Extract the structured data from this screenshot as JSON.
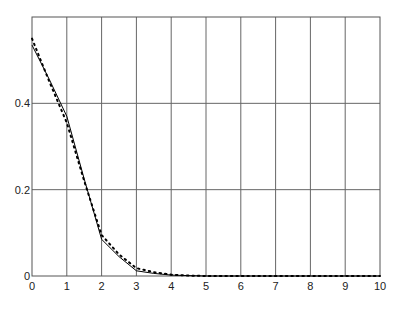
{
  "chart_data": {
    "type": "line",
    "title": "",
    "xlabel": "",
    "ylabel": "",
    "xlim": [
      0,
      10
    ],
    "ylim": [
      0,
      0.6
    ],
    "grid": true,
    "legend": null,
    "x_ticks": [
      "0",
      "1",
      "2",
      "3",
      "4",
      "5",
      "6",
      "7",
      "8",
      "9",
      "10"
    ],
    "y_ticks": [
      "0",
      "0.2",
      "0.4"
    ],
    "x": [
      0,
      0.5,
      1,
      1.5,
      2,
      2.5,
      3,
      3.5,
      4,
      4.5,
      5,
      6,
      7,
      8,
      9,
      10
    ],
    "series": [
      {
        "name": "solid",
        "style": "solid",
        "color": "#000000",
        "values": [
          0.535,
          0.455,
          0.37,
          0.225,
          0.085,
          0.045,
          0.012,
          0.006,
          0.002,
          0.001,
          0.0,
          0.0,
          0.0,
          0.0,
          0.0,
          0.0
        ]
      },
      {
        "name": "dotted",
        "style": "dotted",
        "color": "#000000",
        "values": [
          0.55,
          0.45,
          0.355,
          0.22,
          0.095,
          0.05,
          0.018,
          0.009,
          0.003,
          0.001,
          0.0,
          0.0,
          0.0,
          0.0,
          0.0,
          0.0
        ]
      }
    ]
  }
}
